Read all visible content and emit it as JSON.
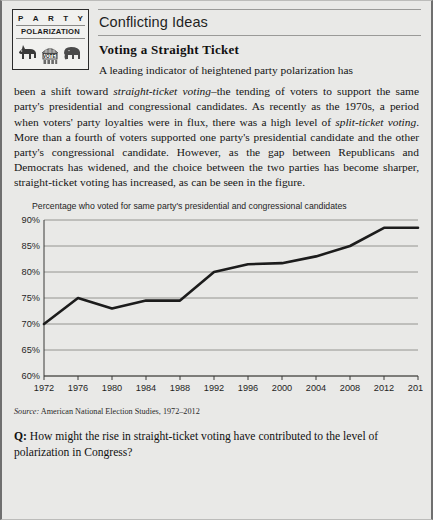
{
  "logo": {
    "word_letters": [
      "P",
      "A",
      "R",
      "T",
      "Y"
    ],
    "subtitle": "POLARIZATION",
    "booth_label": "VOTE!",
    "icons": [
      "donkey-icon",
      "voting-booth-icon",
      "elephant-icon"
    ]
  },
  "header": {
    "feature_title": "Conflicting Ideas",
    "section_title": "Voting a Straight Ticket"
  },
  "body": {
    "line1": "A leading indicator of heightened party polarization has",
    "para_rest_a": "been a shift toward ",
    "italic1": "straight-ticket voting",
    "para_rest_b": "–the tending of voters to support the same party's presidential and congressional candidates. As recently as the 1970s, a period when voters' party loyalties were in flux, there was a high level of ",
    "italic2": "split-ticket voting",
    "para_rest_c": ". More than a fourth of voters supported one party's presidential candidate and the other party's congressional candidate. However, as the gap between Republicans and Democrats has widened, and the choice between the two parties has become sharper, straight-ticket voting has increased, as can be seen in the figure."
  },
  "chart_data": {
    "type": "line",
    "title": "Percentage who voted for same party's presidential and congressional candidates",
    "xlabel": "",
    "ylabel": "",
    "x": [
      1972,
      1976,
      1980,
      1984,
      1988,
      1992,
      1996,
      2000,
      2004,
      2008,
      2012,
      2016
    ],
    "xtick_labels": [
      "1972",
      "1976",
      "1980",
      "1984",
      "1988",
      "1992",
      "1996",
      "2000",
      "2004",
      "2008",
      "2012",
      "2016"
    ],
    "values": [
      70,
      75,
      73,
      74.5,
      74.5,
      80,
      81.5,
      81.7,
      83,
      85,
      88.5,
      88.5
    ],
    "ytick_labels": [
      "90%",
      "85%",
      "80%",
      "75%",
      "70%",
      "65%",
      "60%"
    ],
    "yticks": [
      90,
      85,
      80,
      75,
      70,
      65,
      60
    ],
    "ylim": [
      60,
      90
    ],
    "xlim": [
      1972,
      2016
    ],
    "grid": true,
    "legend": "none",
    "line_color": "#1c1c1c"
  },
  "source": {
    "label": "Source:",
    "text": "American National Election Studies, 1972–2012"
  },
  "question": {
    "marker": "Q:",
    "text": "How might the rise in straight-ticket voting have contributed to the level of polarization in Congress?"
  },
  "colors": {
    "page_bg": "#e9e9e7",
    "ink": "#141414",
    "rule": "#9a9a98",
    "line": "#1c1c1c"
  }
}
